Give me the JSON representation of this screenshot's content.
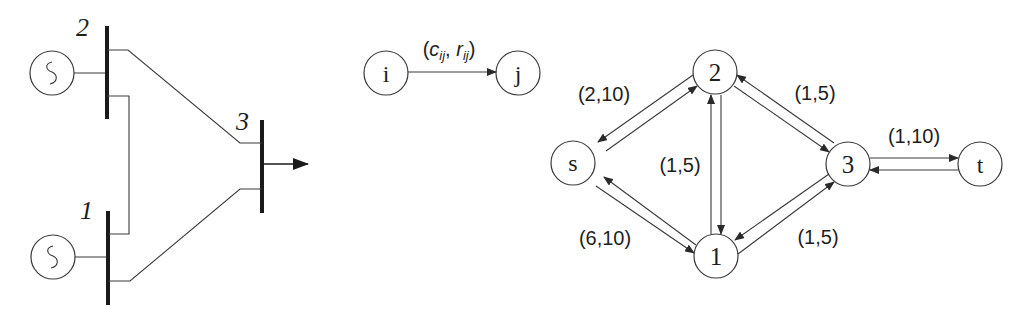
{
  "power_system": {
    "buses": [
      {
        "id": "bus-1",
        "label": "1"
      },
      {
        "id": "bus-2",
        "label": "2"
      },
      {
        "id": "bus-3",
        "label": "3"
      }
    ],
    "generator_symbol": "~"
  },
  "legend": {
    "from_node": "i",
    "to_node": "j",
    "edge_label_open": "(",
    "c": "c",
    "c_sub": "ij",
    "sep": ", ",
    "r": "r",
    "r_sub": "ij",
    "edge_label_close": ")"
  },
  "network": {
    "nodes": {
      "s": "s",
      "n1": "1",
      "n2": "2",
      "n3": "3",
      "t": "t"
    },
    "edge_labels": {
      "s_2": "(2,10)",
      "s_1": "(6,10)",
      "n1_n2": "(1,5)",
      "n2_n3": "(1,5)",
      "n1_n3": "(1,5)",
      "n3_t": "(1,10)"
    }
  }
}
